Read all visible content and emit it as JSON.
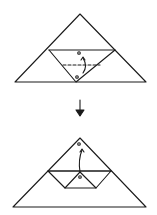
{
  "diagram": {
    "type": "origami-folding-steps",
    "stroke_color": "#1a1a1a",
    "background": "#ffffff",
    "steps": [
      {
        "id": "step-1",
        "shape": "triangle",
        "description": "Triangle with horizontal crease; inverted triangle flap with dashed fold line and arrow folding point up",
        "markers": [
          "circle-top",
          "circle-bottom"
        ]
      },
      {
        "id": "step-2",
        "shape": "triangle",
        "description": "Flap folded up forming trapezoid band with small inner triangle; arrow indicating fold to apex",
        "markers": [
          "circle-apex",
          "circle-center"
        ]
      }
    ],
    "transition_arrow": "down-arrow"
  }
}
